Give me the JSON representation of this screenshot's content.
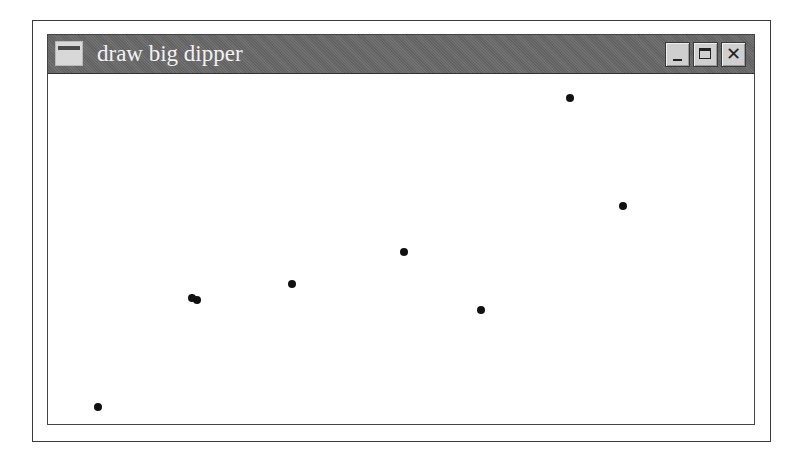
{
  "window": {
    "title": "draw big dipper",
    "buttons": {
      "minimize": "minimize",
      "maximize": "maximize",
      "close": "✕"
    }
  },
  "canvas": {
    "points_page_coords": [
      {
        "x": 98,
        "y": 407
      },
      {
        "x": 192,
        "y": 298
      },
      {
        "x": 197,
        "y": 300
      },
      {
        "x": 292,
        "y": 284
      },
      {
        "x": 404,
        "y": 252
      },
      {
        "x": 481,
        "y": 310
      },
      {
        "x": 570,
        "y": 98
      },
      {
        "x": 623,
        "y": 206
      }
    ],
    "point_color": "#111111"
  }
}
